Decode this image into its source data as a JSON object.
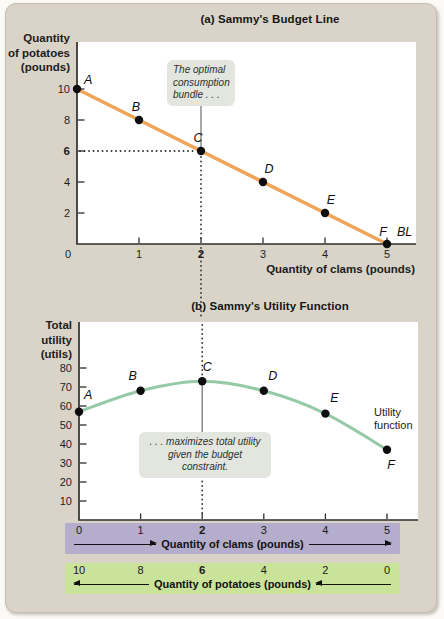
{
  "figure": {
    "panel_a": {
      "title": "(a) Sammy's Budget Line",
      "y_axis_label": "Quantity\nof potatoes\n(pounds)",
      "x_axis_label": "Quantity of clams (pounds)",
      "annotation": "The optimal\nconsumption\nbundle . . .",
      "line_end_label": "BL"
    },
    "panel_b": {
      "title": "(b) Sammy's Utility Function",
      "y_axis_label": "Total\nutility\n(utils)",
      "annotation": ". . . maximizes total utility\ngiven the budget constraint.",
      "curve_label": "Utility function"
    },
    "clams_band": {
      "values": [
        "0",
        "1",
        "2",
        "3",
        "4",
        "5"
      ],
      "bold_value": "2",
      "label": "Quantity of clams (pounds)",
      "arrow_direction": "right"
    },
    "potatoes_band": {
      "values": [
        "10",
        "8",
        "6",
        "4",
        "2",
        "0"
      ],
      "bold_value": "6",
      "label": "Quantity of potatoes (pounds)",
      "arrow_direction": "left"
    }
  },
  "colors": {
    "card_bg": "#d9d4c7",
    "plot_bg": "#ffffff",
    "budget_line": "#f0a457",
    "utility_curve": "#96c9a6",
    "clams_band_bg": "#b4adcb",
    "potatoes_band_bg": "#c9e39b",
    "callout_bg": "#e2e6df",
    "axis": "#2e2e2e",
    "point_dot": "#0d0d0d"
  },
  "chart_data": [
    {
      "type": "line",
      "title": "(a) Sammy's Budget Line",
      "xlabel": "Quantity of clams (pounds)",
      "ylabel": "Quantity of potatoes (pounds)",
      "x": [
        0,
        1,
        2,
        3,
        4,
        5
      ],
      "y": [
        10,
        8,
        6,
        4,
        2,
        0
      ],
      "point_labels": [
        "A",
        "B",
        "C",
        "D",
        "E",
        "F"
      ],
      "line_label": "BL",
      "xticks": [
        0,
        1,
        2,
        3,
        4,
        5
      ],
      "yticks": [
        2,
        4,
        6,
        8,
        10
      ],
      "xlim": [
        0,
        5.45
      ],
      "ylim": [
        0,
        13
      ],
      "emphasized_x": 2,
      "emphasized_y": 6,
      "grid": false,
      "line_color": "#f0a457",
      "annotation": "The optimal\nconsumption\nbundle . . ."
    },
    {
      "type": "line",
      "title": "(b) Sammy's Utility Function",
      "xlabel": "",
      "ylabel": "Total utility (utils)",
      "x": [
        0,
        1,
        2,
        3,
        4,
        5
      ],
      "y": [
        57,
        68,
        73,
        68,
        56,
        37
      ],
      "point_labels": [
        "A",
        "B",
        "C",
        "D",
        "E",
        "F"
      ],
      "line_label": "Utility function",
      "xticks": [
        1,
        2,
        3,
        4,
        5
      ],
      "yticks": [
        10,
        20,
        30,
        40,
        50,
        60,
        70,
        80
      ],
      "xlim": [
        0,
        5.5
      ],
      "ylim": [
        0,
        104
      ],
      "emphasized_x": 2,
      "grid": false,
      "line_color": "#96c9a6",
      "annotation": ". . . maximizes total utility\ngiven the budget constraint."
    }
  ]
}
